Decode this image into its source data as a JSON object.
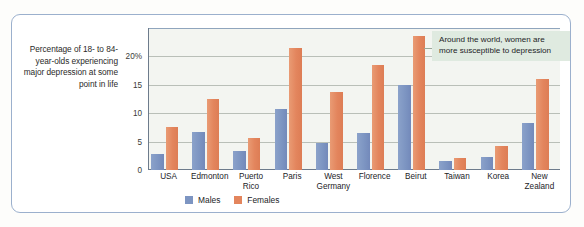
{
  "chart_data": {
    "type": "bar",
    "title": "",
    "subtitle": "",
    "ylabel": "Percentage of 18- to 84-year-olds experiencing major depression at some point in life",
    "xlabel": "",
    "ylim": [
      0,
      25
    ],
    "yticks": [
      0,
      5,
      10,
      15,
      20
    ],
    "ytick_labels": [
      "0",
      "5",
      "10",
      "15",
      "20%"
    ],
    "grid": true,
    "legend_position": "bottom-left",
    "categories": [
      "USA",
      "Edmonton",
      "Puerto Rico",
      "Paris",
      "West Germany",
      "Florence",
      "Beirut",
      "Taiwan",
      "Korea",
      "New Zealand"
    ],
    "series": [
      {
        "name": "Males",
        "color": "#7d95c2",
        "values": [
          2.9,
          6.7,
          3.4,
          10.8,
          4.8,
          6.6,
          14.9,
          1.5,
          2.3,
          8.2
        ]
      },
      {
        "name": "Females",
        "color": "#e3855d",
        "values": [
          7.6,
          12.5,
          5.7,
          21.5,
          13.8,
          18.5,
          23.6,
          2.1,
          4.3,
          16.1
        ]
      }
    ],
    "annotations": [
      {
        "text": "Around the world, women are more susceptible to depression"
      }
    ]
  },
  "figure": {
    "axis_caption": "Percentage of 18- to 84-year-olds experiencing major depression at some point in life",
    "annotation_text": "Around the world, women are more susceptible to depression"
  },
  "legend": {
    "items": [
      {
        "label": "Males",
        "color": "#7d95c2"
      },
      {
        "label": "Females",
        "color": "#e3855d"
      }
    ]
  }
}
